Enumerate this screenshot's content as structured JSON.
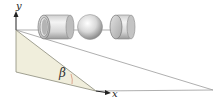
{
  "diagram": {
    "type": "inclined-plane-rolling-objects",
    "labels": {
      "y_axis": "y",
      "x_axis": "x",
      "angle": "β"
    },
    "objects": [
      {
        "name": "hollow-cylinder"
      },
      {
        "name": "sphere"
      },
      {
        "name": "solid-cylinder"
      }
    ],
    "colors": {
      "wedge_fill": "#f0eedc",
      "lines": "#8a8a8a",
      "axis": "#222222",
      "angle_arc": "#d4826a"
    }
  }
}
